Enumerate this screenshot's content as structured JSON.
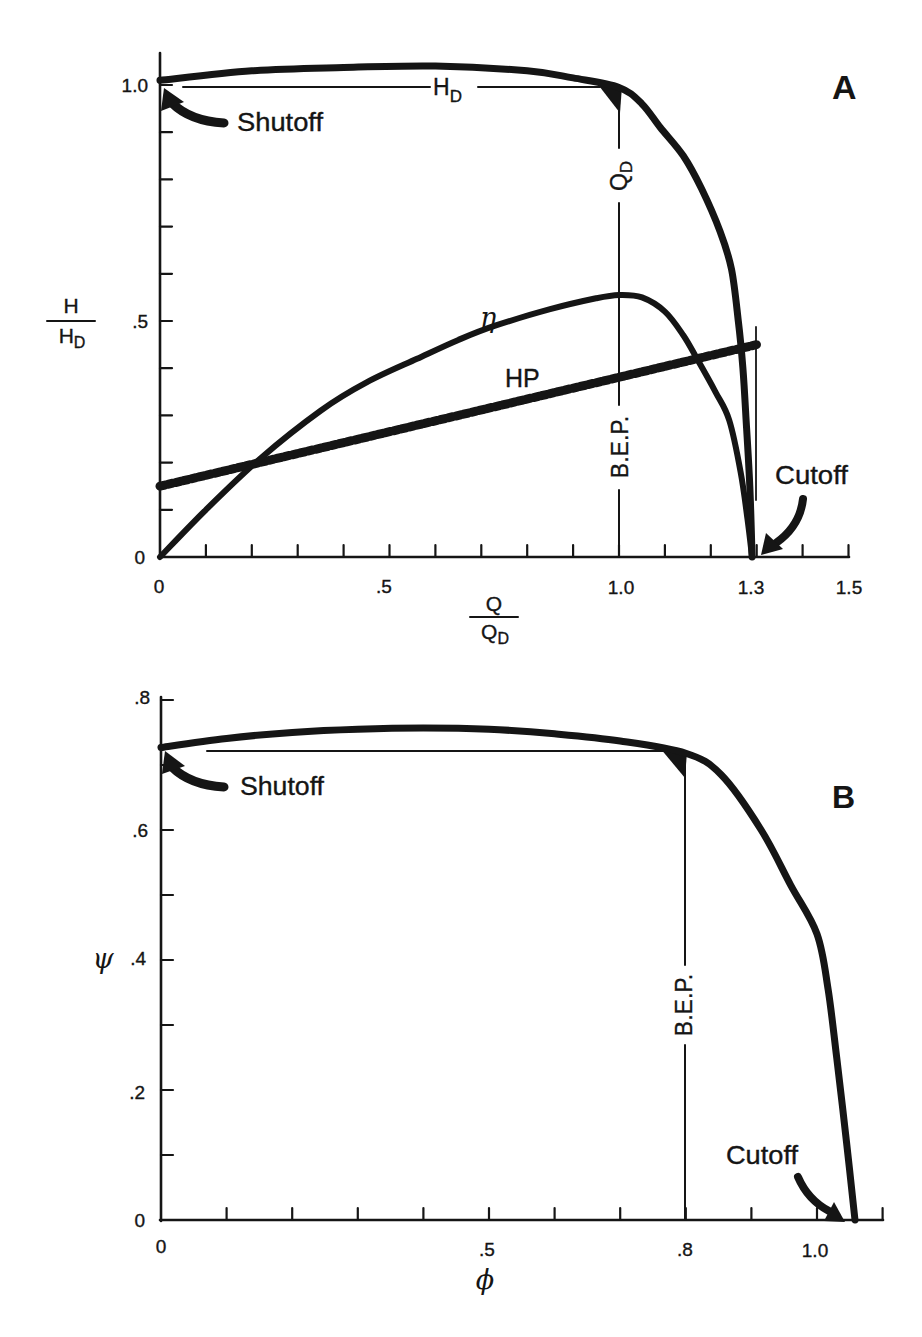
{
  "figure": {
    "panels": [
      "A",
      "B"
    ],
    "ink_color": "#151515",
    "background": "#ffffff"
  },
  "chart_data": [
    {
      "panel": "A",
      "panel_label": "A",
      "type": "line",
      "title": "",
      "xlabel": {
        "num": "Q",
        "den": "Q",
        "den_sub": "D"
      },
      "ylabel": {
        "num": "H",
        "den": "H",
        "den_sub": "D"
      },
      "xlim": [
        0,
        1.5
      ],
      "ylim": [
        0,
        1.0
      ],
      "xticks": [
        0,
        0.5,
        1.0,
        1.3,
        1.5
      ],
      "xtick_labels": [
        "0",
        ".5",
        "1.0",
        "1.3",
        "1.5"
      ],
      "yticks": [
        0,
        0.5,
        1.0
      ],
      "ytick_labels": [
        "0",
        ".5",
        "1.0"
      ],
      "minor_tick_step": 0.1,
      "grid": false,
      "legend": "none (inline labels)",
      "series": [
        {
          "name": "H/H_D",
          "label": "Head",
          "style": "solid-thick",
          "x": [
            0,
            0.2,
            0.4,
            0.6,
            0.8,
            0.9,
            1.0,
            1.05,
            1.09,
            1.14,
            1.18,
            1.22,
            1.245,
            1.26,
            1.27,
            1.277,
            1.285,
            1.29
          ],
          "y": [
            1.01,
            1.03,
            1.037,
            1.04,
            1.03,
            1.015,
            0.995,
            0.96,
            0.91,
            0.85,
            0.78,
            0.69,
            0.61,
            0.5,
            0.4,
            0.29,
            0.15,
            0
          ]
        },
        {
          "name": "η",
          "label": "η",
          "style": "solid",
          "x": [
            0,
            0.1,
            0.22,
            0.35,
            0.45,
            0.56,
            0.65,
            0.73,
            0.85,
            0.95,
            1.0,
            1.05,
            1.1,
            1.14,
            1.17,
            1.21,
            1.24,
            1.265,
            1.28,
            1.29
          ],
          "y": [
            0,
            0.1,
            0.21,
            0.31,
            0.37,
            0.42,
            0.46,
            0.49,
            0.525,
            0.548,
            0.555,
            0.55,
            0.52,
            0.47,
            0.42,
            0.35,
            0.29,
            0.18,
            0.08,
            0
          ]
        },
        {
          "name": "HP",
          "label": "HP",
          "style": "dashed-thick",
          "x": [
            0,
            1.3
          ],
          "y": [
            0.15,
            0.45
          ]
        }
      ],
      "annotations": {
        "design_head_label": {
          "main": "H",
          "sub": "D"
        },
        "design_head_y": 1.0,
        "design_flow_label": {
          "main": "Q",
          "sub": "D"
        },
        "bep_label": "B.E.P.",
        "bep_x": 1.0,
        "shutoff_label": "Shutoff",
        "cutoff_label": "Cutoff",
        "cutoff_x": 1.3,
        "eta_label": "η",
        "hp_label": "HP"
      }
    },
    {
      "panel": "B",
      "panel_label": "B",
      "type": "line",
      "title": "",
      "xlabel": "ϕ",
      "ylabel": "ψ",
      "xlim": [
        0,
        1.1
      ],
      "ylim": [
        0,
        0.8
      ],
      "xticks": [
        0,
        0.5,
        0.8,
        1.0
      ],
      "xtick_labels": [
        "0",
        ".5",
        ".8",
        "1.0"
      ],
      "yticks": [
        0,
        0.2,
        0.4,
        0.6,
        0.8
      ],
      "ytick_labels": [
        "0",
        ".2",
        ".4",
        ".6",
        ".8"
      ],
      "minor_tick_step": 0.1,
      "grid": false,
      "legend": "none",
      "series": [
        {
          "name": "ψ",
          "label": "Head coefficient",
          "style": "solid-thick",
          "x": [
            0,
            0.1,
            0.2,
            0.3,
            0.4,
            0.5,
            0.6,
            0.7,
            0.8,
            0.854,
            0.915,
            0.96,
            1.0,
            1.017,
            1.03,
            1.045,
            1.058
          ],
          "y": [
            0.727,
            0.741,
            0.75,
            0.755,
            0.757,
            0.755,
            0.748,
            0.737,
            0.718,
            0.685,
            0.6,
            0.515,
            0.44,
            0.354,
            0.25,
            0.12,
            0
          ]
        }
      ],
      "annotations": {
        "bep_label": "B.E.P.",
        "bep_x": 0.8,
        "bep_psi": 0.718,
        "shutoff_label": "Shutoff",
        "cutoff_label": "Cutoff",
        "cutoff_x": 1.058
      }
    }
  ]
}
